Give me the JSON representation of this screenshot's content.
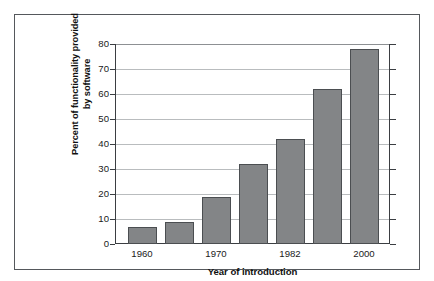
{
  "chart_data": {
    "type": "bar",
    "title": "",
    "xlabel": "Year of introduction",
    "ylabel": "Percent of functionality provided by software",
    "ylabel_lines": [
      "Percent of functionality provided",
      "by software"
    ],
    "categories": [
      "1960",
      "",
      "1970",
      "",
      "1982",
      "",
      "2000"
    ],
    "visible_tick_labels": [
      "1960",
      "1970",
      "1982",
      "2000"
    ],
    "values": [
      7,
      9,
      19,
      32,
      42,
      62,
      78
    ],
    "ylim": [
      0,
      80
    ],
    "yticks": [
      0,
      10,
      20,
      30,
      40,
      50,
      60,
      70,
      80
    ],
    "ytick_labels": [
      "0",
      "10",
      "20",
      "30",
      "40",
      "50",
      "60",
      "70",
      "80"
    ],
    "grid": true,
    "legend": false,
    "bar_color": "#838587",
    "bar_edge_color": "#4b4e51",
    "gridline_color": "#b9bcbe",
    "axis_color": "#3b3e42",
    "frame_color": "#55585c",
    "background_color": "#ffffff"
  }
}
